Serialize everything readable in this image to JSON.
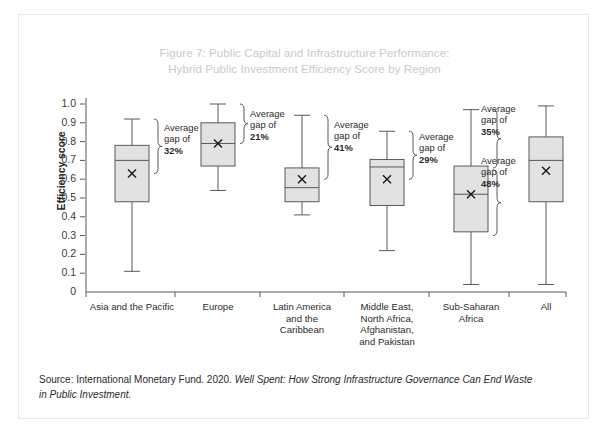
{
  "figure": {
    "title_line1": "Figure 7: Public Capital and Infrastructure Performance:",
    "title_line2": "Hybrid Public Investment Efficiency Score by Region",
    "source_prefix": "Source: International Monetary Fund. 2020. ",
    "source_italic": "Well Spent: How Strong Infrastructure Governance Can End Waste in Public Investment.",
    "colors": {
      "title": "#c9c9c9",
      "box_fill": "#e2e2e2",
      "box_stroke": "#58585a",
      "axis": "#58585a",
      "text": "#2b2b2b",
      "frame": "#e8e8e8"
    }
  },
  "chart_data": {
    "type": "box",
    "title": "Figure 7: Public Capital and Infrastructure Performance: Hybrid Public Investment Efficiency Score by Region",
    "xlabel": "",
    "ylabel": "Efficiency score",
    "ylim": [
      0,
      1.0
    ],
    "yticks": [
      "0",
      "0.1",
      "0.2",
      "0.3",
      "0.4",
      "0.5",
      "0.6",
      "0.7",
      "0.8",
      "0.9",
      "1.0"
    ],
    "ytick_values": [
      0,
      0.1,
      0.2,
      0.3,
      0.4,
      0.5,
      0.6,
      0.7,
      0.8,
      0.9,
      1.0
    ],
    "grid": false,
    "legend": "none",
    "categories": [
      "Asia and the Pacific",
      "Europe",
      "Latin America and the Caribbean",
      "Middle East, North Africa, Afghanistan, and Pakistan",
      "Sub-Saharan Africa",
      "All"
    ],
    "category_label_lines": [
      [
        "Asia and the Pacific"
      ],
      [
        "Europe"
      ],
      [
        "Latin America",
        "and the",
        "Caribbean"
      ],
      [
        "Middle East,",
        "North Africa,",
        "Afghanistan,",
        "and Pakistan"
      ],
      [
        "Sub-Saharan",
        "Africa"
      ],
      [
        "All"
      ]
    ],
    "boxes": [
      {
        "category": "Asia and the Pacific",
        "whisker_low": 0.11,
        "q1": 0.48,
        "median": 0.7,
        "q3": 0.78,
        "whisker_high": 0.92,
        "mean": 0.63
      },
      {
        "category": "Europe",
        "whisker_low": 0.54,
        "q1": 0.67,
        "median": 0.79,
        "q3": 0.9,
        "whisker_high": 1.0,
        "mean": 0.79
      },
      {
        "category": "Latin America and the Caribbean",
        "whisker_low": 0.41,
        "q1": 0.48,
        "median": 0.555,
        "q3": 0.66,
        "whisker_high": 0.94,
        "mean": 0.6
      },
      {
        "category": "Middle East, North Africa, Afghanistan, and Pakistan",
        "whisker_low": 0.22,
        "q1": 0.46,
        "median": 0.665,
        "q3": 0.705,
        "whisker_high": 0.855,
        "mean": 0.6
      },
      {
        "category": "Sub-Saharan Africa",
        "whisker_low": 0.04,
        "q1": 0.32,
        "median": 0.52,
        "q3": 0.67,
        "whisker_high": 0.97,
        "mean": 0.52
      },
      {
        "category": "All",
        "whisker_low": 0.04,
        "q1": 0.48,
        "median": 0.7,
        "q3": 0.825,
        "whisker_high": 0.99,
        "mean": 0.645
      }
    ],
    "annotations": [
      {
        "category": "Asia and the Pacific",
        "label_line1": "Average",
        "label_line2": "gap of",
        "value": "32%",
        "span_top": 0.92,
        "span_bottom": 0.63
      },
      {
        "category": "Europe",
        "label_line1": "Average",
        "label_line2": "gap of",
        "value": "21%",
        "span_top": 1.0,
        "span_bottom": 0.79
      },
      {
        "category": "Latin America and the Caribbean",
        "label_line1": "Average",
        "label_line2": "gap of",
        "value": "41%",
        "span_top": 0.94,
        "span_bottom": 0.6
      },
      {
        "category": "Middle East, North Africa, Afghanistan, and Pakistan",
        "label_line1": "Average",
        "label_line2": "gap of",
        "value": "29%",
        "span_top": 0.855,
        "span_bottom": 0.6
      },
      {
        "category": "Sub-Saharan Africa",
        "label_line1": "Average",
        "label_line2": "gap of",
        "value": "35%",
        "span_top": 0.97,
        "span_bottom": 0.66
      },
      {
        "category": "Sub-Saharan Africa",
        "label_line1": "Average",
        "label_line2": "gap of",
        "value": "48%",
        "span_top": 0.65,
        "span_bottom": 0.3
      }
    ]
  }
}
